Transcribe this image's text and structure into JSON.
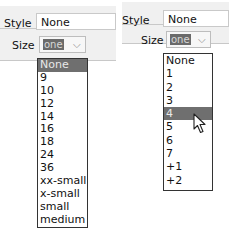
{
  "left_panel": {
    "style_label": "Style",
    "style_value": "None",
    "size_label": "Size",
    "size_value": "one",
    "dropdown_options": [
      "None",
      "9",
      "10",
      "12",
      "14",
      "16",
      "18",
      "24",
      "36",
      "xx-small",
      "x-small",
      "small",
      "medium"
    ],
    "highlighted_index": 0
  },
  "right_panel": {
    "style_label": "Style",
    "style_value": "None",
    "size_label": "Size",
    "size_value": "one",
    "dropdown_options": [
      "None",
      "1",
      "2",
      "3",
      "4",
      "5",
      "6",
      "7",
      "+1",
      "+2"
    ],
    "highlighted_index": 4
  },
  "icons": {
    "chevron": "⌄",
    "cursor": "mouse-pointer"
  },
  "colors": {
    "highlight": "#6f6f6f",
    "panel_bg": "#f0f0f0",
    "border": "#333333"
  }
}
